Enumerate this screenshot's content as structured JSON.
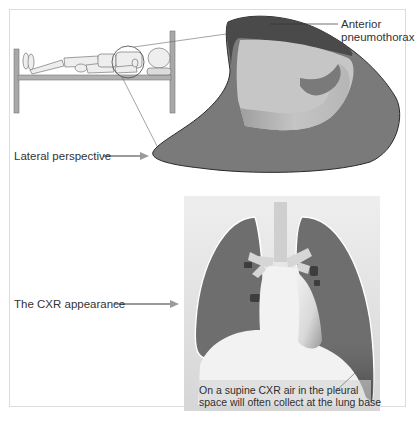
{
  "figure": {
    "labels": {
      "anterior_line1": "Anterior",
      "anterior_line2": "pneumothorax",
      "lateral": "Lateral perspective",
      "cxr": "The CXR appearance",
      "caption_line1": "On a supine CXR air in the pleural",
      "caption_line2": "space will often collect at the lung base"
    },
    "icons": {
      "patient": "supine-mannequin-on-bed",
      "magnifier": "circle-zoom-indicator",
      "arrow": "right-arrow"
    },
    "colors": {
      "lung_dark": "#6a6a6a",
      "lung_mid": "#8a8a8a",
      "air_dark": "#4a4a4a",
      "lung_light": "#c8c8c8",
      "panel_bg": "#e4e4e4",
      "mediastinum": "#f2f2f2",
      "bed": "#9a9a9a",
      "arrow": "#9a9a9a"
    }
  }
}
